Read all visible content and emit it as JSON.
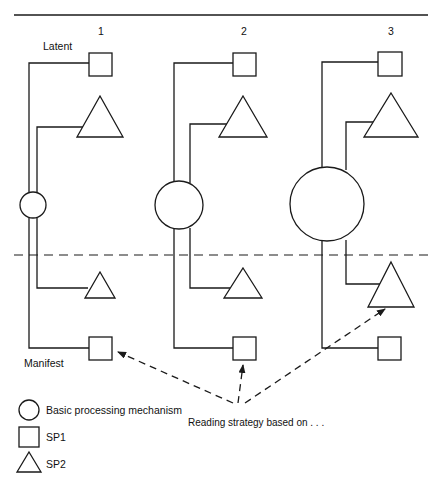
{
  "figure": {
    "top_rule": true,
    "columns": [
      {
        "id": "col1",
        "label": "1"
      },
      {
        "id": "col2",
        "label": "2"
      },
      {
        "id": "col3",
        "label": "3"
      }
    ],
    "level_labels": {
      "latent": "Latent",
      "manifest": "Manifest"
    },
    "divider": {
      "style": "dashed",
      "color": "#1a1a1a"
    },
    "annotation": {
      "text": "Reading strategy based on . . .",
      "arrow_style": "dashed",
      "targets": [
        "manifest-sp1-col1",
        "manifest-sp1-col2",
        "manifest-sp2-col3"
      ]
    },
    "legend": {
      "items": [
        {
          "shape": "circle",
          "label": "Basic processing mechanism"
        },
        {
          "shape": "square",
          "label": "SP1"
        },
        {
          "shape": "triangle",
          "label": "SP2"
        }
      ]
    },
    "colors": {
      "stroke": "#1a1a1a",
      "background": "#ffffff",
      "text": "#111111"
    },
    "nodes": {
      "col1": {
        "circle_radius": 13,
        "latent_sp1": "square",
        "latent_sp2": "triangle",
        "manifest_sp2": "triangle",
        "manifest_sp1": "square"
      },
      "col2": {
        "circle_radius": 24,
        "latent_sp1": "square",
        "latent_sp2": "triangle",
        "manifest_sp2": "triangle",
        "manifest_sp1": "square"
      },
      "col3": {
        "circle_radius": 37,
        "latent_sp1": "square",
        "latent_sp2": "triangle",
        "manifest_sp2": "triangle",
        "manifest_sp1": "square"
      }
    }
  }
}
